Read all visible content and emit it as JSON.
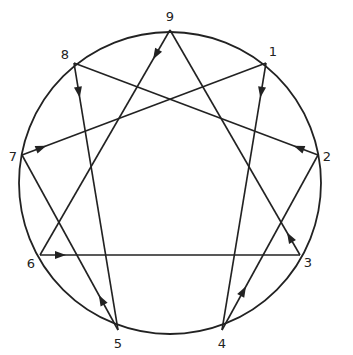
{
  "diagram": {
    "type": "enneagram",
    "colors": {
      "stroke": "#222222",
      "background": "#ffffff"
    },
    "circle": {
      "cx": 170,
      "cy": 183,
      "r": 151
    },
    "points": [
      {
        "id": "9",
        "label": "9",
        "x": 170,
        "y": 30,
        "lx": 170,
        "ly": 17
      },
      {
        "id": "1",
        "label": "1",
        "x": 266,
        "y": 63,
        "lx": 273,
        "ly": 52
      },
      {
        "id": "2",
        "label": "2",
        "x": 318,
        "y": 155,
        "lx": 327,
        "ly": 157
      },
      {
        "id": "3",
        "label": "3",
        "x": 300,
        "y": 255,
        "lx": 308,
        "ly": 263
      },
      {
        "id": "4",
        "label": "4",
        "x": 222,
        "y": 330,
        "lx": 222,
        "ly": 344
      },
      {
        "id": "5",
        "label": "5",
        "x": 118,
        "y": 330,
        "lx": 118,
        "ly": 344
      },
      {
        "id": "6",
        "label": "6",
        "x": 40,
        "y": 255,
        "lx": 31,
        "ly": 264
      },
      {
        "id": "7",
        "label": "7",
        "x": 22,
        "y": 155,
        "lx": 13,
        "ly": 157
      },
      {
        "id": "8",
        "label": "8",
        "x": 74,
        "y": 63,
        "lx": 65,
        "ly": 55
      }
    ],
    "edges": [
      {
        "from": "9",
        "to": "6",
        "arrow_t": 0.13
      },
      {
        "from": "3",
        "to": "9",
        "arrow_t": 0.1
      },
      {
        "from": "8",
        "to": "5",
        "arrow_t": 0.13
      },
      {
        "from": "2",
        "to": "8",
        "arrow_t": 0.1
      },
      {
        "from": "1",
        "to": "4",
        "arrow_t": 0.13
      },
      {
        "from": "7",
        "to": "1",
        "arrow_t": 0.1
      },
      {
        "from": "5",
        "to": "7",
        "arrow_t": 0.2
      },
      {
        "from": "6",
        "to": "3",
        "arrow_t": 0.1
      },
      {
        "from": "4",
        "to": "2",
        "arrow_t": 0.25
      }
    ]
  }
}
